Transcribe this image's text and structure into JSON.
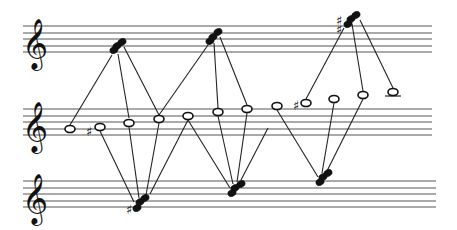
{
  "diagram": {
    "type": "voice-leading score diagram",
    "clef_glyph": "𝄞",
    "sharp_glyph": "♯",
    "staves": [
      {
        "name": "top-staff",
        "lines_y": [
          26,
          33,
          39,
          46,
          52
        ],
        "x_start": 23,
        "x_end": 432,
        "clef_x": 22
      },
      {
        "name": "middle-staff",
        "lines_y": [
          109,
          116,
          122,
          129,
          135
        ],
        "x_start": 23,
        "x_end": 432,
        "clef_x": 22
      },
      {
        "name": "bottom-staff",
        "lines_y": [
          181,
          188,
          194,
          201,
          207
        ],
        "x_start": 23,
        "x_end": 436,
        "clef_x": 22
      }
    ],
    "top_chords": [
      {
        "id": "t1",
        "noteheads": [
          [
            114,
            50
          ],
          [
            117,
            46
          ],
          [
            122,
            42
          ]
        ],
        "sharp": null
      },
      {
        "id": "t2",
        "noteheads": [
          [
            210,
            41
          ],
          [
            213,
            37
          ],
          [
            218,
            32
          ]
        ],
        "sharp": null
      },
      {
        "id": "t3",
        "noteheads": [
          [
            348,
            24
          ],
          [
            351,
            19
          ],
          [
            356,
            15
          ]
        ],
        "sharp": {
          "x": 336,
          "y": 30,
          "count": 2
        }
      }
    ],
    "middle_notes": [
      {
        "id": "m1",
        "x": 70,
        "y": 129,
        "sharp": null
      },
      {
        "id": "m2",
        "x": 100,
        "y": 127,
        "sharp": {
          "x": 86,
          "y": 132
        }
      },
      {
        "id": "m3",
        "x": 129,
        "y": 123,
        "sharp": null
      },
      {
        "id": "m4",
        "x": 159,
        "y": 119,
        "sharp": null
      },
      {
        "id": "m5",
        "x": 188,
        "y": 116,
        "sharp": null
      },
      {
        "id": "m6",
        "x": 218,
        "y": 112,
        "sharp": null
      },
      {
        "id": "m7",
        "x": 247,
        "y": 109,
        "sharp": null
      },
      {
        "id": "m8",
        "x": 277,
        "y": 106,
        "sharp": null
      },
      {
        "id": "m9",
        "x": 306,
        "y": 103,
        "sharp": {
          "x": 293,
          "y": 106
        }
      },
      {
        "id": "m10",
        "x": 334,
        "y": 99,
        "sharp": null
      },
      {
        "id": "m11",
        "x": 363,
        "y": 95,
        "sharp": null
      },
      {
        "id": "m12",
        "x": 393,
        "y": 92,
        "sharp": null,
        "ledger": true
      }
    ],
    "bottom_chords": [
      {
        "id": "b1",
        "noteheads": [
          [
            137,
            208
          ],
          [
            140,
            202
          ],
          [
            145,
            198
          ]
        ],
        "sharp": {
          "x": 126,
          "y": 210
        }
      },
      {
        "id": "b2",
        "noteheads": [
          [
            232,
            193
          ],
          [
            235,
            188
          ],
          [
            241,
            184
          ]
        ],
        "sharp": null
      },
      {
        "id": "b3",
        "noteheads": [
          [
            320,
            182
          ],
          [
            323,
            177
          ],
          [
            328,
            173
          ]
        ],
        "sharp": null
      }
    ],
    "connections": [
      [
        70,
        125,
        112,
        55
      ],
      [
        129,
        118,
        118,
        54
      ],
      [
        159,
        115,
        124,
        47
      ],
      [
        100,
        131,
        134,
        202
      ],
      [
        129,
        127,
        139,
        198
      ],
      [
        159,
        123,
        146,
        195
      ],
      [
        188,
        120,
        150,
        194
      ],
      [
        159,
        115,
        208,
        45
      ],
      [
        218,
        108,
        214,
        43
      ],
      [
        247,
        105,
        220,
        37
      ],
      [
        188,
        120,
        230,
        188
      ],
      [
        218,
        116,
        233,
        184
      ],
      [
        247,
        113,
        237,
        182
      ],
      [
        268,
        128,
        241,
        180
      ],
      [
        306,
        99,
        344,
        28
      ],
      [
        363,
        91,
        352,
        24
      ],
      [
        393,
        88,
        360,
        20
      ],
      [
        277,
        110,
        318,
        177
      ],
      [
        334,
        103,
        322,
        173
      ],
      [
        363,
        99,
        327,
        171
      ]
    ]
  }
}
